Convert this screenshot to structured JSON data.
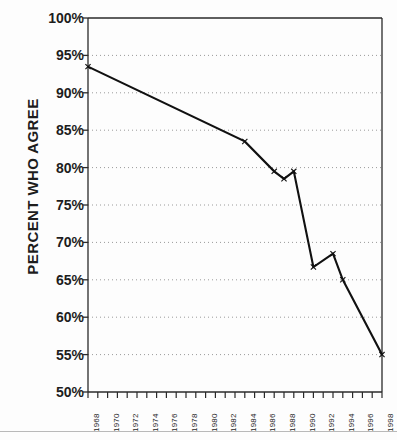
{
  "chart_data": {
    "type": "line",
    "title": "",
    "subtitle": "",
    "xlabel": "",
    "ylabel": "PERCENT WHO AGREE",
    "ylim": [
      50,
      100
    ],
    "xlim": [
      1968,
      1998
    ],
    "ytick_labels": [
      "100%",
      "95%",
      "90%",
      "85%",
      "80%",
      "75%",
      "70%",
      "65%",
      "60%",
      "55%",
      "50%"
    ],
    "ytick_values": [
      100,
      95,
      90,
      85,
      80,
      75,
      70,
      65,
      60,
      55,
      50
    ],
    "xtick_labels": [
      "1968",
      "1970",
      "1972",
      "1974",
      "1976",
      "1978",
      "1980",
      "1982",
      "1984",
      "1986",
      "1988",
      "1990",
      "1992",
      "1994",
      "1996",
      "1998"
    ],
    "xtick_values": [
      1968,
      1970,
      1972,
      1974,
      1976,
      1978,
      1980,
      1982,
      1984,
      1986,
      1988,
      1990,
      1992,
      1994,
      1996,
      1998
    ],
    "minor_xticks_every": 1,
    "grid": "horizontal-dotted",
    "legend": "none",
    "marker": "x",
    "line_color": "#111111",
    "grid_color": "#9a9a9a",
    "axis_color": "#2a2a2a",
    "series": [
      {
        "name": "Percent who agree",
        "x": [
          1968,
          1984,
          1987,
          1988,
          1989,
          1991,
          1993,
          1994,
          1998
        ],
        "values": [
          93.5,
          83.5,
          79.5,
          78.5,
          79.5,
          66.7,
          68.5,
          65.0,
          55.0
        ]
      }
    ]
  },
  "figure": {
    "background": "#fdfdfd",
    "plot_background": "#ffffff"
  }
}
